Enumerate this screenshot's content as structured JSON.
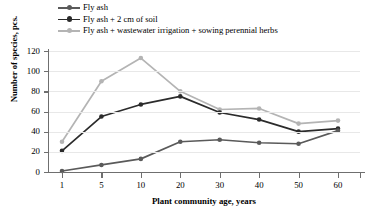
{
  "chart_data": {
    "type": "line",
    "title": "",
    "xlabel": "Plant community age, years",
    "ylabel": "Number of species, pcs.",
    "categories": [
      "1",
      "5",
      "10",
      "20",
      "30",
      "40",
      "50",
      "60"
    ],
    "x": [
      1,
      5,
      10,
      20,
      30,
      40,
      50,
      60
    ],
    "ylim": [
      0,
      120
    ],
    "yticks": [
      "0",
      "20",
      "40",
      "60",
      "80",
      "100",
      "120"
    ],
    "ytick_values": [
      0,
      20,
      40,
      60,
      80,
      100,
      120
    ],
    "grid": "horizontal",
    "legend_position": "top-left",
    "series": [
      {
        "name": "Fly ash",
        "color": "#5a5a5a",
        "marker": "circle",
        "values": [
          1,
          7,
          13,
          30,
          32,
          29,
          28,
          41
        ]
      },
      {
        "name": "Fly ash + 2 cm of soil",
        "color": "#2b2b2b",
        "marker": "circle",
        "values": [
          21,
          55,
          67,
          75,
          59,
          52,
          40,
          43
        ]
      },
      {
        "name": "Fly ash + wastewater irrigation + sowing perennial herbs",
        "color": "#b4b4b4",
        "marker": "circle",
        "values": [
          30,
          90,
          113,
          80,
          62,
          63,
          48,
          51
        ]
      }
    ],
    "axis_color": "#6f6f6f",
    "grid_color": "#e8e8e8"
  }
}
